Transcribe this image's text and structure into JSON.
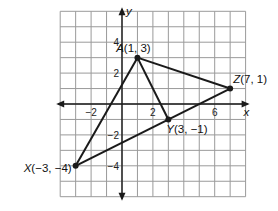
{
  "diagram": {
    "type": "coordinate-plane-triangles",
    "grid": {
      "x_min": -4,
      "x_max": 8,
      "y_min": -6,
      "y_max": 6,
      "step": 1
    },
    "axes": {
      "x_label": "x",
      "y_label": "y"
    },
    "x_ticks": [
      {
        "value": -2,
        "label": "−2"
      },
      {
        "value": 2,
        "label": "2"
      },
      {
        "value": 6,
        "label": "6"
      }
    ],
    "y_ticks": [
      {
        "value": 4,
        "label": "4"
      },
      {
        "value": 2,
        "label": "2"
      },
      {
        "value": -2,
        "label": "−2"
      },
      {
        "value": -4,
        "label": "−4"
      }
    ],
    "points": [
      {
        "name": "A",
        "x": 1,
        "y": 3,
        "label_name": "A",
        "label_coords": "(1, 3)"
      },
      {
        "name": "Z",
        "x": 7,
        "y": 1,
        "label_name": "Z",
        "label_coords": "(7, 1)"
      },
      {
        "name": "Y",
        "x": 3,
        "y": -1,
        "label_name": "Y",
        "label_coords": "(3, −1)"
      },
      {
        "name": "X",
        "x": -3,
        "y": -4,
        "label_name": "X",
        "label_coords": "(−3, −4)"
      }
    ],
    "segments": [
      [
        "A",
        "Z"
      ],
      [
        "A",
        "X"
      ],
      [
        "A",
        "Y"
      ],
      [
        "X",
        "Z"
      ]
    ],
    "colors": {
      "grid": "#9a9a9a",
      "lines": "#1a1a1a",
      "background": "#ffffff"
    }
  }
}
